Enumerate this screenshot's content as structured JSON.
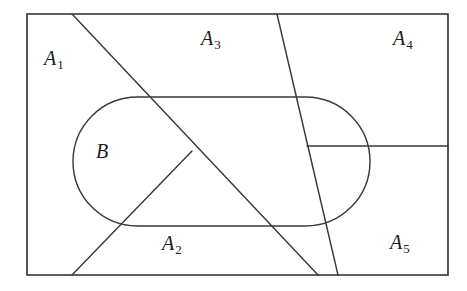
{
  "figure": {
    "kind": "set-partition-venn-diagram",
    "stroke_color": "#2b2b2b",
    "background_color": "#ffffff",
    "labels": {
      "A1": {
        "base": "A",
        "sub": "1"
      },
      "A2": {
        "base": "A",
        "sub": "2"
      },
      "A3": {
        "base": "A",
        "sub": "3"
      },
      "A4": {
        "base": "A",
        "sub": "4"
      },
      "A5": {
        "base": "A",
        "sub": "5"
      },
      "B": {
        "base": "B",
        "sub": ""
      }
    },
    "geometry": {
      "outer_rect": {
        "x": 27,
        "y": 14,
        "width": 421,
        "height": 261
      },
      "stadium": {
        "x": 73,
        "y": 97,
        "width": 297,
        "height": 129,
        "radius": 64.5
      },
      "cut_main_diagonal": {
        "x1": 72,
        "y1": 14,
        "x2": 318,
        "y2": 275
      },
      "cut_steep_line": {
        "x1": 277,
        "y1": 14,
        "x2": 338,
        "y2": 275
      },
      "cut_v_branch": {
        "x1": 192,
        "y1": 151,
        "x2": 72,
        "y2": 275
      },
      "cut_horizontal": {
        "x1": 307,
        "y1": 146,
        "x2": 448,
        "y2": 146
      }
    }
  }
}
